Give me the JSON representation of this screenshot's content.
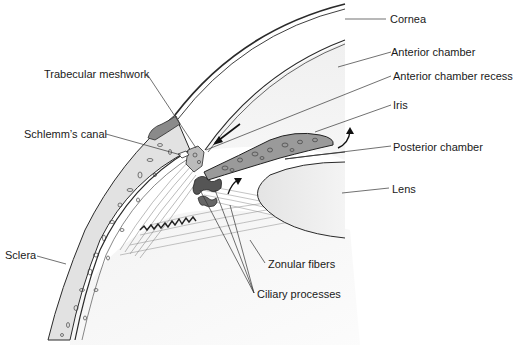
{
  "diagram": {
    "type": "anatomical cross-section",
    "colors": {
      "line": "#2a2a2a",
      "fill_light": "#ececec",
      "fill_lens": "#e8e8e8",
      "sclera": "#dedede",
      "background": "#ffffff"
    },
    "labels": [
      {
        "id": "cornea",
        "text": "Cornea"
      },
      {
        "id": "anterior-chamber",
        "text": "Anterior chamber"
      },
      {
        "id": "anterior-chamber-recess",
        "text": "Anterior chamber recess"
      },
      {
        "id": "iris",
        "text": "Iris"
      },
      {
        "id": "posterior-chamber",
        "text": "Posterior chamber"
      },
      {
        "id": "lens",
        "text": "Lens"
      },
      {
        "id": "trabecular-meshwork",
        "text": "Trabecular meshwork"
      },
      {
        "id": "schlemms-canal",
        "text": "Schlemm’s canal"
      },
      {
        "id": "sclera",
        "text": "Sclera"
      },
      {
        "id": "zonular-fibers",
        "text": "Zonular fibers"
      },
      {
        "id": "ciliary-processes",
        "text": "Ciliary processes"
      }
    ],
    "arrows": [
      {
        "id": "aqueous-flow-to-angle",
        "direction": "down-left"
      },
      {
        "id": "aqueous-flow-through-pupil",
        "direction": "up"
      },
      {
        "id": "aqueous-flow-from-ciliary-body",
        "direction": "up-right"
      }
    ]
  }
}
